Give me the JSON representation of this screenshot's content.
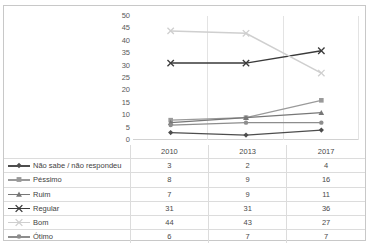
{
  "chart_data": {
    "type": "line",
    "title": "",
    "subtitle": "",
    "xlabel": "",
    "ylabel": "",
    "categories": [
      "2010",
      "2013",
      "2017"
    ],
    "ylim": [
      0,
      50
    ],
    "yticks": [
      0,
      5,
      10,
      15,
      20,
      25,
      30,
      35,
      40,
      45,
      50
    ],
    "ytick_labels": [
      "0",
      "5",
      "10",
      "15",
      "20",
      "25",
      "30",
      "35",
      "40",
      "45",
      "50"
    ],
    "grid": "vertical",
    "legend_position": "table-left",
    "has_data_table": true,
    "series": [
      {
        "name": "Não sabe / não respondeu",
        "values": [
          3,
          2,
          4
        ],
        "color": "#4d4d4d",
        "marker": "diamond"
      },
      {
        "name": "Péssimo",
        "values": [
          8,
          9,
          16
        ],
        "color": "#9a9a9a",
        "marker": "square"
      },
      {
        "name": "Ruim",
        "values": [
          7,
          9,
          11
        ],
        "color": "#777777",
        "marker": "triangle"
      },
      {
        "name": "Regular",
        "values": [
          31,
          31,
          36
        ],
        "color": "#3a3a3a",
        "marker": "x"
      },
      {
        "name": "Bom",
        "values": [
          44,
          43,
          27
        ],
        "color": "#cfcfcf",
        "marker": "x"
      },
      {
        "name": "Ótimo",
        "values": [
          6,
          7,
          7
        ],
        "color": "#8d8d8d",
        "marker": "circle"
      }
    ]
  },
  "table": {
    "header_blank": "",
    "columns": [
      "2010",
      "2013",
      "2017"
    ],
    "rows": [
      {
        "label": "Não sabe / não respondeu",
        "values": [
          "3",
          "2",
          "4"
        ]
      },
      {
        "label": "Péssimo",
        "values": [
          "8",
          "9",
          "16"
        ]
      },
      {
        "label": "Ruim",
        "values": [
          "7",
          "9",
          "11"
        ]
      },
      {
        "label": "Regular",
        "values": [
          "31",
          "31",
          "36"
        ]
      },
      {
        "label": "Bom",
        "values": [
          "44",
          "43",
          "27"
        ]
      },
      {
        "label": "Ótimo",
        "values": [
          "6",
          "7",
          "7"
        ]
      }
    ]
  }
}
